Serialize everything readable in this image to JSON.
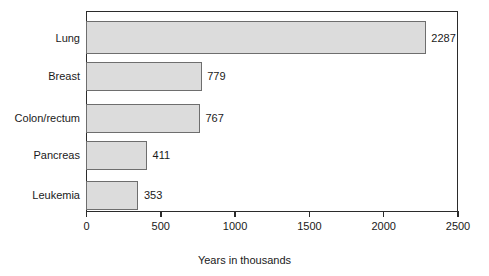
{
  "chart_data": {
    "type": "bar",
    "orientation": "horizontal",
    "title": "",
    "xlabel": "Years in thousands",
    "ylabel": "",
    "categories": [
      "Lung",
      "Breast",
      "Colon/rectum",
      "Pancreas",
      "Leukemia"
    ],
    "values": [
      2287,
      779,
      767,
      411,
      353
    ],
    "value_labels": [
      "2287",
      "779",
      "767",
      "411",
      "353"
    ],
    "xlim": [
      0,
      2500
    ],
    "xticks": [
      0,
      500,
      1000,
      1500,
      2000,
      2500
    ],
    "xtick_labels": [
      "0",
      "500",
      "1000",
      "1500",
      "2000",
      "2500"
    ],
    "grid": false,
    "legend": null,
    "colors": {
      "bar_fill": "#dcdcdc",
      "bar_stroke": "#6e6e6e",
      "axis": "#2b2b2b",
      "text": "#1a1a1a",
      "background": "#ffffff"
    }
  }
}
